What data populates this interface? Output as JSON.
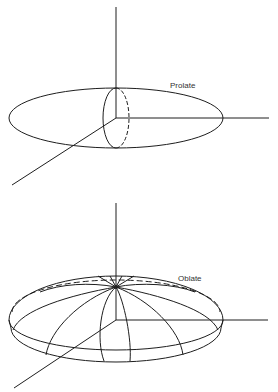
{
  "figure": {
    "type": "diagram",
    "panels": [
      {
        "id": "prolate",
        "label": "Prolate",
        "description": "Prolate spheroid: elongated ellipse along horizontal axis with dashed circular cross-section at center",
        "axes": [
          "vertical",
          "horizontal",
          "diagonal"
        ]
      },
      {
        "id": "oblate",
        "label": "Oblate",
        "description": "Oblate spheroid: flattened disk shape with meridian lines converging at top pole and dashed back equator",
        "axes": [
          "vertical",
          "horizontal",
          "diagonal"
        ]
      }
    ]
  },
  "colors": {
    "line": "#1e1e1e",
    "background": "#ffffff"
  }
}
